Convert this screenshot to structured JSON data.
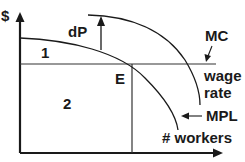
{
  "diagram": {
    "y_axis_label": "$",
    "x_axis_label": "# workers",
    "labels": {
      "dp": "dP",
      "mc": "MC",
      "wage_line_1": "wage",
      "wage_line_2": "rate",
      "mpl": "MPL",
      "equilibrium": "E",
      "area_1": "1",
      "area_2": "2"
    },
    "colors": {
      "line": "#1a1a1a",
      "background": "#ffffff"
    }
  }
}
